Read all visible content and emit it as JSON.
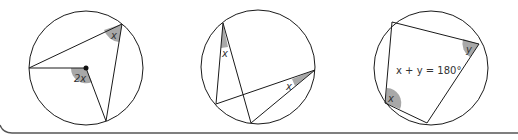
{
  "colors": {
    "stroke": "#1a1a1a",
    "shade": "#a8a8a8",
    "text": "#333333",
    "frame": "#555555"
  },
  "diagrams": [
    {
      "name": "angle-at-centre",
      "labels": {
        "inscribed_angle": "x",
        "central_angle": "2x"
      }
    },
    {
      "name": "angles-same-segment",
      "labels": {
        "angle_a": "x",
        "angle_b": "x"
      }
    },
    {
      "name": "cyclic-quadrilateral",
      "labels": {
        "angle_x": "x",
        "angle_y": "y",
        "equation": "x + y = 180°"
      }
    }
  ]
}
